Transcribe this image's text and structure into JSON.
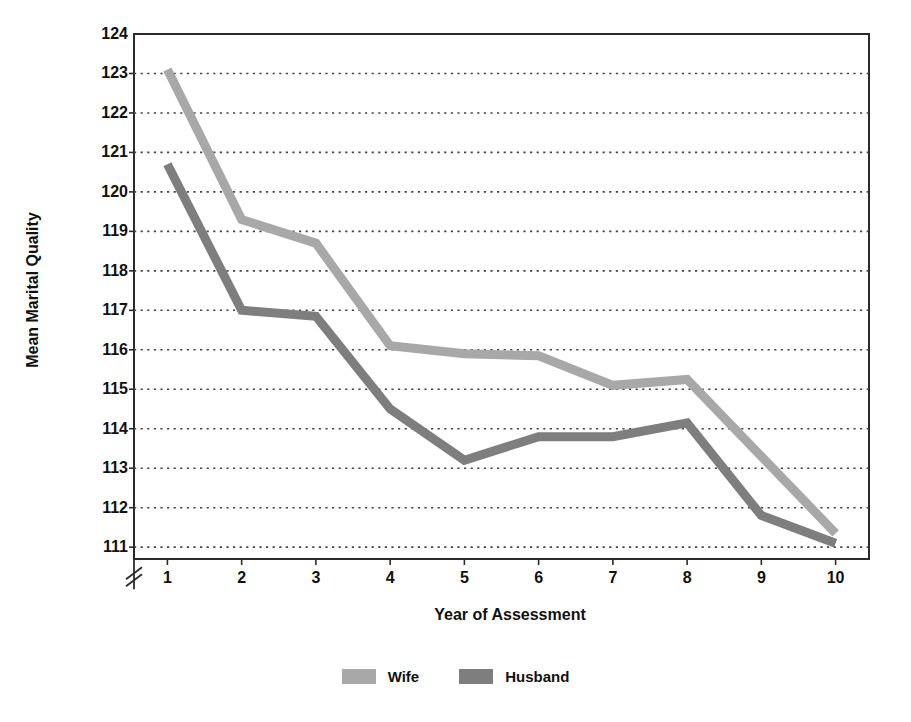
{
  "chart_data": {
    "type": "line",
    "title": "",
    "xlabel": "Year of Assessment",
    "ylabel": "Mean Marital Quality",
    "categories": [
      1,
      2,
      3,
      4,
      5,
      6,
      7,
      8,
      9,
      10
    ],
    "x_tick_labels": [
      "1",
      "2",
      "3",
      "4",
      "5",
      "6",
      "7",
      "8",
      "9",
      "10"
    ],
    "y_tick_labels": [
      "124",
      "123",
      "122",
      "121",
      "120",
      "119",
      "118",
      "117",
      "116",
      "115",
      "114",
      "113",
      "112",
      "111"
    ],
    "y_ticks": [
      124,
      123,
      122,
      121,
      120,
      119,
      118,
      117,
      116,
      115,
      114,
      113,
      112,
      111
    ],
    "ylim": [
      110.7,
      124
    ],
    "xlim": [
      0.55,
      10.45
    ],
    "grid": "horizontal-dotted",
    "axis_break": true,
    "axis_break_symbol": "//",
    "legend_position": "bottom-center",
    "series": [
      {
        "name": "Wife",
        "color": "#a8a8a8",
        "values": [
          123.1,
          119.3,
          118.7,
          116.1,
          115.9,
          115.85,
          115.1,
          115.25,
          113.3,
          111.35
        ]
      },
      {
        "name": "Husband",
        "color": "#7e7e7e",
        "values": [
          120.7,
          117.0,
          116.85,
          114.5,
          113.2,
          113.8,
          113.8,
          114.15,
          111.8,
          111.1
        ]
      }
    ]
  },
  "axes": {
    "y_title": "Mean Marital Quality",
    "x_title": "Year of Assessment"
  },
  "legend": {
    "items": [
      {
        "label": "Wife",
        "color": "#a8a8a8"
      },
      {
        "label": "Husband",
        "color": "#7e7e7e"
      }
    ]
  },
  "colors": {
    "wife": "#a8a8a8",
    "husband": "#7e7e7e",
    "axis": "#2b2b2b",
    "grid": "#444444",
    "text": "#111111",
    "background": "#ffffff"
  }
}
